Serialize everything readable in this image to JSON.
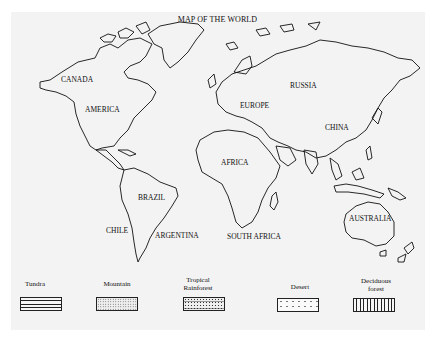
{
  "map": {
    "title": "MAP OF THE WORLD",
    "labels": {
      "canada": "CANADA",
      "america": "AMERICA",
      "europe": "EUROPE",
      "russia": "RUSSIA",
      "china": "CHINA",
      "africa": "AFRICA",
      "brazil": "BRAZIL",
      "chile": "CHILE",
      "argentina": "ARGENTINA",
      "south_africa": "SOUTH AFRICA",
      "australia": "AUSTRALIA"
    }
  },
  "legend": {
    "items": [
      {
        "label": "Tundra",
        "pattern": "horizontal-lines"
      },
      {
        "label": "Mountain",
        "pattern": "crosshatch-dots"
      },
      {
        "label_line1": "Tropical",
        "label_line2": "Rainforest",
        "pattern": "dense-dots"
      },
      {
        "label": "Desert",
        "pattern": "sparse-dots"
      },
      {
        "label_line1": "Deciduous",
        "label_line2": "forest",
        "pattern": "vertical-lines"
      }
    ]
  }
}
